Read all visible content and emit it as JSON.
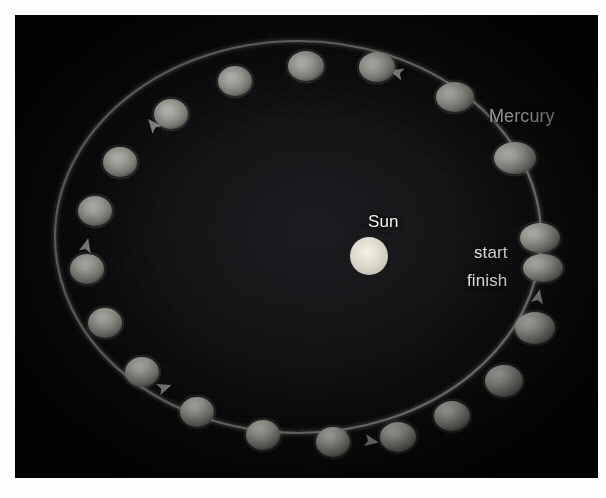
{
  "figure": {
    "panel_background_color": "#0c0c0f",
    "orbit_line_color": "#b9b9b2",
    "planet_color": "#c9c9c2",
    "sun_color": "#dedcd2",
    "label_color": "#f2f2f0",
    "caption": "",
    "labels": {
      "mercury": "Mercury",
      "sun": "Sun",
      "start": "start",
      "finish": "finish"
    }
  },
  "chart_data": {
    "type": "scatter",
    "title": "Mercury",
    "subtitle": "",
    "xlabel": "",
    "ylabel": "",
    "grid": false,
    "legend_position": "none",
    "annotations": [
      {
        "text": "Mercury",
        "x": 474,
        "y": 92
      },
      {
        "text": "Sun",
        "x": 353,
        "y": 198
      },
      {
        "text": "start",
        "x": 459,
        "y": 229
      },
      {
        "text": "finish",
        "x": 452,
        "y": 257
      }
    ],
    "orbit": {
      "shape": "ellipse",
      "center_x": 283,
      "center_y": 222,
      "radius_x": 243,
      "radius_y": 196,
      "direction": "counterclockwise",
      "stroke_width": 2.2
    },
    "sun": {
      "x": 354,
      "y": 241,
      "radius": 19
    },
    "series": [
      {
        "name": "Mercury positions",
        "points": [
          {
            "label": "start",
            "x": 525,
            "y": 223,
            "rx": 20,
            "ry": 15
          },
          {
            "label": "finish",
            "x": 528,
            "y": 253,
            "rx": 20,
            "ry": 14
          },
          {
            "label": "p3",
            "x": 520,
            "y": 313,
            "rx": 20,
            "ry": 16
          },
          {
            "label": "p4",
            "x": 489,
            "y": 366,
            "rx": 19,
            "ry": 16
          },
          {
            "label": "p5",
            "x": 437,
            "y": 401,
            "rx": 18,
            "ry": 15
          },
          {
            "label": "p6",
            "x": 383,
            "y": 422,
            "rx": 18,
            "ry": 15
          },
          {
            "label": "p7",
            "x": 318,
            "y": 427,
            "rx": 17,
            "ry": 15
          },
          {
            "label": "p8",
            "x": 248,
            "y": 420,
            "rx": 17,
            "ry": 15
          },
          {
            "label": "p9",
            "x": 182,
            "y": 397,
            "rx": 17,
            "ry": 15
          },
          {
            "label": "p10",
            "x": 127,
            "y": 357,
            "rx": 17,
            "ry": 15
          },
          {
            "label": "p11",
            "x": 90,
            "y": 308,
            "rx": 17,
            "ry": 15
          },
          {
            "label": "p12",
            "x": 72,
            "y": 254,
            "rx": 17,
            "ry": 15
          },
          {
            "label": "p13",
            "x": 80,
            "y": 196,
            "rx": 17,
            "ry": 15
          },
          {
            "label": "p14",
            "x": 105,
            "y": 147,
            "rx": 17,
            "ry": 15
          },
          {
            "label": "p15",
            "x": 156,
            "y": 99,
            "rx": 17,
            "ry": 15
          },
          {
            "label": "p16",
            "x": 220,
            "y": 66,
            "rx": 17,
            "ry": 15
          },
          {
            "label": "p17",
            "x": 291,
            "y": 51,
            "rx": 18,
            "ry": 15
          },
          {
            "label": "p18",
            "x": 362,
            "y": 52,
            "rx": 18,
            "ry": 15
          },
          {
            "label": "p19",
            "x": 440,
            "y": 82,
            "rx": 19,
            "ry": 15
          },
          {
            "label": "p20",
            "x": 500,
            "y": 143,
            "rx": 21,
            "ry": 16
          }
        ]
      }
    ],
    "arrows": [
      {
        "name": "arrow-top",
        "x": 383,
        "y": 58,
        "angle": 196
      },
      {
        "name": "arrow-upper-left",
        "x": 139,
        "y": 111,
        "angle": 230
      },
      {
        "name": "arrow-left",
        "x": 71,
        "y": 232,
        "angle": 284
      },
      {
        "name": "arrow-lower-left",
        "x": 148,
        "y": 373,
        "angle": 340
      },
      {
        "name": "arrow-bottom",
        "x": 355,
        "y": 426,
        "angle": 10
      },
      {
        "name": "arrow-right",
        "x": 523,
        "y": 283,
        "angle": 282
      }
    ]
  }
}
